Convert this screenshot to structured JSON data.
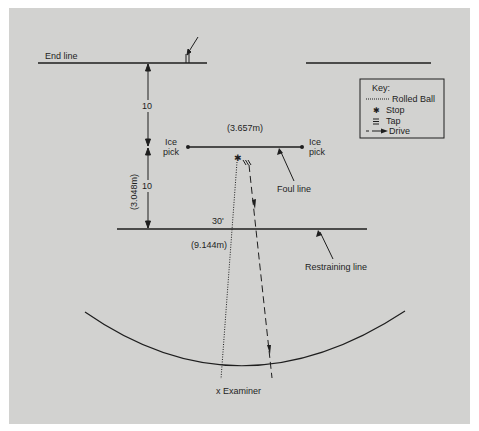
{
  "diagram": {
    "background_color": "#d2d2d0",
    "line_color": "#1e1e1e",
    "labels": {
      "end_line": "End line",
      "ice_pick_left_1": "Ice",
      "ice_pick_left_2": "pick",
      "ice_pick_right_1": "Ice",
      "ice_pick_right_2": "pick",
      "foul_line_width": "(3.657m)",
      "foul_line": "Foul line",
      "dist_upper": "10",
      "dist_lower": "10",
      "dist_metric": "(3.048m)",
      "restraining_dist": "30'",
      "restraining_metric": "(9.144m)",
      "restraining_line": "Restraining line",
      "examiner": "x  Examiner"
    },
    "key": {
      "title": "Key:",
      "items": [
        {
          "symbol": "dotted-line",
          "label": "Rolled Ball"
        },
        {
          "symbol": "asterisk",
          "glyph": "✱",
          "label": "Stop"
        },
        {
          "symbol": "triple-bar",
          "glyph": "☰",
          "label": "Tap"
        },
        {
          "symbol": "dashed-arrow",
          "label": "Drive"
        }
      ]
    }
  }
}
